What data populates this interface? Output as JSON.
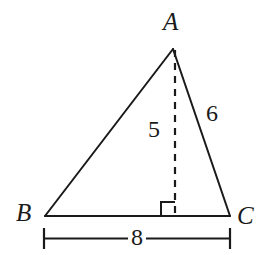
{
  "figure": {
    "background_color": "#ffffff",
    "stroke_color": "#1a1a1a",
    "vertices": {
      "A": {
        "label": "A",
        "x": 173,
        "y": 48
      },
      "B": {
        "label": "B",
        "x": 45,
        "y": 216
      },
      "C": {
        "label": "C",
        "x": 230,
        "y": 216
      }
    },
    "altitude": {
      "label": "5",
      "from": "A",
      "foot_x": 175,
      "foot_y": 216,
      "style": "dashed"
    },
    "right_angle": {
      "name": "right-angle-marker",
      "x": 161,
      "y": 202,
      "size": 14
    },
    "side_labels": {
      "ac": "6",
      "altitude": "5"
    },
    "base_measure": {
      "label": "8",
      "start_x": 44,
      "end_x": 230,
      "y": 238
    }
  }
}
